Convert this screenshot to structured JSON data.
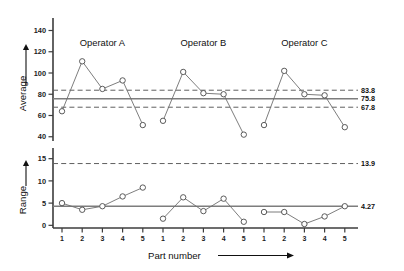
{
  "figure": {
    "title": "",
    "background": "#ffffff",
    "line_color": "#6e6e6e",
    "marker_edge_color": "#4a4a4a",
    "center_line_color": "#7d7d7d",
    "limit_line_color": "#5f5f5f",
    "text_color": "#111111"
  },
  "group_labels": [
    "Operator A",
    "Operator B",
    "Operator C"
  ],
  "x_axis": {
    "label": "Part number",
    "arrow": "right",
    "tick_labels": [
      "1",
      "2",
      "3",
      "4",
      "5",
      "1",
      "2",
      "3",
      "4",
      "5",
      "1",
      "2",
      "3",
      "4",
      "5"
    ]
  },
  "average_chart": {
    "y_label": "Average",
    "y_arrow": "up",
    "y_ticks": [
      "40",
      "60",
      "80",
      "100",
      "120",
      "140"
    ],
    "ucl_label": "83.8",
    "center_label": "75.8",
    "lcl_label": "67.8"
  },
  "range_chart": {
    "y_label": "Range",
    "y_arrow": "up",
    "y_ticks": [
      "0",
      "5",
      "10",
      "15"
    ],
    "ucl_label": "13.9",
    "center_label": "4.27"
  },
  "chart_data": [
    {
      "type": "line",
      "title": "Average chart (X-bar)",
      "xlabel": "Part number",
      "ylabel": "Average",
      "ylim": [
        36,
        148
      ],
      "yticks": [
        40,
        60,
        80,
        100,
        120,
        140
      ],
      "grid": false,
      "legend": "none",
      "x": [
        1,
        2,
        3,
        4,
        5,
        6,
        7,
        8,
        9,
        10,
        11,
        12,
        13,
        14,
        15
      ],
      "xtick_labels": [
        "1",
        "2",
        "3",
        "4",
        "5",
        "1",
        "2",
        "3",
        "4",
        "5",
        "1",
        "2",
        "3",
        "4",
        "5"
      ],
      "series": [
        {
          "name": "Operator A",
          "x": [
            1,
            2,
            3,
            4,
            5
          ],
          "values": [
            64,
            111,
            85,
            93,
            51
          ]
        },
        {
          "name": "Operator B",
          "x": [
            6,
            7,
            8,
            9,
            10
          ],
          "values": [
            55,
            101,
            81,
            80,
            42
          ]
        },
        {
          "name": "Operator C",
          "x": [
            11,
            12,
            13,
            14,
            15
          ],
          "values": [
            51,
            102,
            80,
            79,
            49
          ]
        }
      ],
      "control_lines": [
        {
          "name": "UCL",
          "value": 83.8,
          "style": "dashed",
          "label": "83.8"
        },
        {
          "name": "Center",
          "value": 75.8,
          "style": "solid",
          "label": "75.8"
        },
        {
          "name": "LCL",
          "value": 67.8,
          "style": "dashed",
          "label": "67.8"
        }
      ],
      "annotations": [
        "Operator A",
        "Operator B",
        "Operator C"
      ]
    },
    {
      "type": "line",
      "title": "Range chart (R)",
      "xlabel": "Part number",
      "ylabel": "Range",
      "ylim": [
        -0.6,
        16.5
      ],
      "yticks": [
        0,
        5,
        10,
        15
      ],
      "grid": false,
      "legend": "none",
      "x": [
        1,
        2,
        3,
        4,
        5,
        6,
        7,
        8,
        9,
        10,
        11,
        12,
        13,
        14,
        15
      ],
      "xtick_labels": [
        "1",
        "2",
        "3",
        "4",
        "5",
        "1",
        "2",
        "3",
        "4",
        "5",
        "1",
        "2",
        "3",
        "4",
        "5"
      ],
      "series": [
        {
          "name": "Operator A",
          "x": [
            1,
            2,
            3,
            4,
            5
          ],
          "values": [
            5.0,
            3.5,
            4.3,
            6.5,
            8.5
          ]
        },
        {
          "name": "Operator B",
          "x": [
            6,
            7,
            8,
            9,
            10
          ],
          "values": [
            1.5,
            6.3,
            3.2,
            6.0,
            0.8
          ]
        },
        {
          "name": "Operator C",
          "x": [
            11,
            12,
            13,
            14,
            15
          ],
          "values": [
            3.0,
            3.0,
            0.3,
            2.0,
            4.3
          ]
        }
      ],
      "control_lines": [
        {
          "name": "UCL",
          "value": 13.9,
          "style": "dashed",
          "label": "13.9"
        },
        {
          "name": "Center",
          "value": 4.27,
          "style": "solid",
          "label": "4.27"
        }
      ],
      "annotations": []
    }
  ]
}
